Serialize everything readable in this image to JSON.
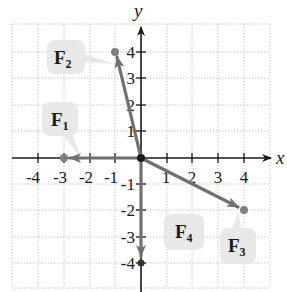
{
  "figure": {
    "type": "vector-diagram",
    "axes": {
      "x_label": "x",
      "y_label": "y",
      "x_ticks": [
        "-4",
        "-3",
        "-2",
        "-1",
        "1",
        "2",
        "3",
        "4"
      ],
      "y_ticks": [
        "4",
        "3",
        "2",
        "1",
        "-1",
        "-2",
        "-3",
        "-4"
      ],
      "range": {
        "x": [
          -4,
          4
        ],
        "y": [
          -4,
          4
        ]
      }
    },
    "vectors": [
      {
        "name": "F",
        "sub": "1",
        "tail": [
          0,
          0
        ],
        "head": [
          -3,
          0
        ]
      },
      {
        "name": "F",
        "sub": "2",
        "tail": [
          0,
          0
        ],
        "head": [
          -1,
          4
        ]
      },
      {
        "name": "F",
        "sub": "3",
        "tail": [
          0,
          0
        ],
        "head": [
          4,
          -2
        ]
      },
      {
        "name": "F",
        "sub": "4",
        "tail": [
          0,
          0
        ],
        "head": [
          0,
          -4
        ]
      }
    ],
    "colors": {
      "vector": "#707070",
      "axis": "#1a1a1a",
      "grid": "#c8c8c8",
      "label_bg": "#e8e8e8",
      "point": "#808080"
    }
  }
}
